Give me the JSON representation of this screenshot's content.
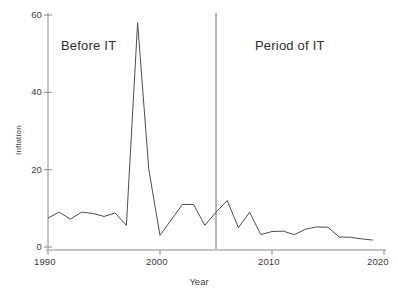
{
  "chart_data": {
    "type": "line",
    "title": "",
    "xlabel": "Year",
    "ylabel": "Inflation",
    "xlim": [
      1990,
      2020
    ],
    "ylim": [
      0,
      60
    ],
    "xticks": [
      1990,
      2000,
      2010,
      2020
    ],
    "yticks": [
      0,
      20,
      40,
      60
    ],
    "grid": false,
    "legend": "none",
    "x": [
      1990,
      1991,
      1992,
      1993,
      1994,
      1995,
      1996,
      1997,
      1998,
      1999,
      2000,
      2001,
      2002,
      2003,
      2004,
      2005,
      2006,
      2007,
      2008,
      2009,
      2010,
      2011,
      2012,
      2013,
      2014,
      2015,
      2016,
      2017,
      2018,
      2019
    ],
    "series": [
      {
        "name": "Inflation",
        "color": "#4d4d4d",
        "values": [
          7.5,
          9.0,
          7.2,
          9.0,
          8.7,
          7.9,
          8.8,
          5.6,
          58.0,
          20.0,
          3.0,
          7.0,
          11.0,
          11.0,
          5.6,
          9.0,
          12.0,
          5.0,
          9.0,
          3.2,
          4.0,
          4.1,
          3.2,
          4.6,
          5.2,
          5.1,
          2.6,
          2.5,
          2.1,
          1.8
        ]
      }
    ],
    "annotations": [
      {
        "name": "before-it-label",
        "text": "Before IT",
        "x": 1993.5,
        "y": 52
      },
      {
        "name": "period-of-it-label",
        "text": "Period of IT",
        "x": 2012.5,
        "y": 52
      }
    ],
    "vertical_divider": {
      "name": "regime-divider",
      "x": 2005,
      "color": "#6e6e6e"
    }
  },
  "axes": {
    "xtick_labels": [
      "1990",
      "2000",
      "2010",
      "2020"
    ],
    "ytick_labels": [
      "0",
      "20",
      "40",
      "60"
    ],
    "x_title": "Year",
    "y_title": "Inflation"
  },
  "labels": {
    "before": "Before IT",
    "after": "Period of IT"
  },
  "colors": {
    "line": "#4d4d4d",
    "axis": "#8a8a8a",
    "divider": "#6e6e6e",
    "text": "#303030",
    "background": "#ffffff"
  }
}
